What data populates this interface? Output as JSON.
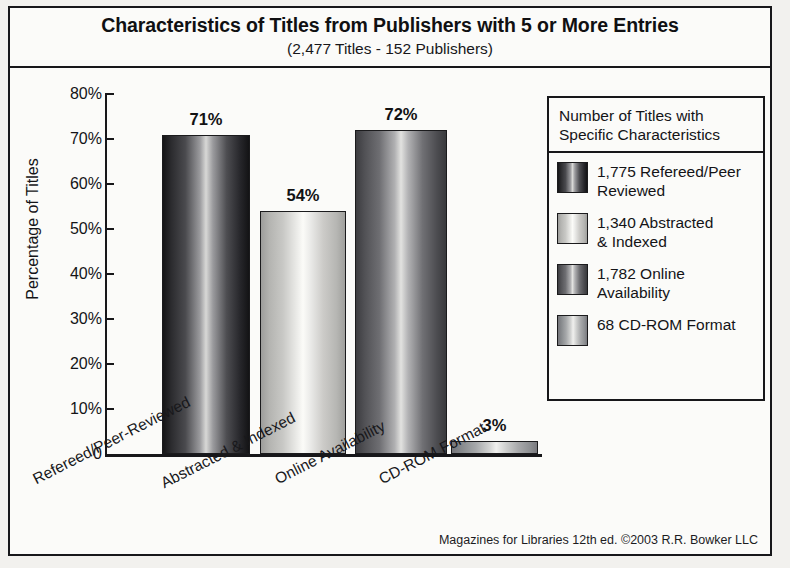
{
  "chart_data": {
    "type": "bar",
    "title": "Characteristics of Titles from Publishers with 5 or More Entries",
    "subtitle": "(2,477 Titles - 152 Publishers)",
    "xlabel": "",
    "ylabel": "Percentage of Titles",
    "categories": [
      "Refereed/Peer-Reviewed",
      "Abstracted & Indexed",
      "Online Availability",
      "CD-ROM Format"
    ],
    "values": [
      71,
      54,
      72,
      3
    ],
    "value_labels": [
      "71%",
      "54%",
      "72%",
      "3%"
    ],
    "counts": [
      1775,
      1340,
      1782,
      68
    ],
    "ylim": [
      0,
      80
    ],
    "yticks": [
      0,
      10,
      20,
      30,
      40,
      50,
      60,
      70,
      80
    ],
    "ytick_labels": [
      "0",
      "10%",
      "20%",
      "30%",
      "40%",
      "50%",
      "60%",
      "70%",
      "80%"
    ],
    "grid": false,
    "legend_position": "right",
    "bar_styles": [
      "bar-dark",
      "bar-light",
      "bar-mid",
      "bar-midlight"
    ]
  },
  "legend": {
    "heading_line1": "Number of Titles with",
    "heading_line2": "Specific Characteristics",
    "items": [
      {
        "label_line1": "1,775 Refereed/Peer",
        "label_line2": "Reviewed",
        "style": "bar-dark"
      },
      {
        "label_line1": "1,340 Abstracted",
        "label_line2": "& Indexed",
        "style": "bar-light"
      },
      {
        "label_line1": "1,782 Online",
        "label_line2": "Availability",
        "style": "bar-mid"
      },
      {
        "label_line1": "68 CD-ROM Format",
        "label_line2": "",
        "style": "bar-midlight"
      }
    ]
  },
  "credit": "Magazines for Libraries 12th ed. ©2003 R.R. Bowker LLC",
  "colors": {
    "frame": "#17171a",
    "paper": "#f2f1ee",
    "panel": "#fbfbf9",
    "text": "#141417"
  },
  "ghost_text": [
    {
      "t": "the Overall",
      "x": 300,
      "y": 42,
      "size": 21
    },
    {
      "t": "blications",
      "x": 470,
      "y": 60,
      "size": 19
    },
    {
      "t": "a little, the",
      "x": 190,
      "y": 78,
      "size": 17
    },
    {
      "t": "liable to variate",
      "x": 360,
      "y": 78,
      "size": 17
    },
    {
      "t": "Titles",
      "x": 230,
      "y": 100,
      "size": 18
    },
    {
      "t": "and Indexed contents of",
      "x": 320,
      "y": 100,
      "size": 18
    },
    {
      "t": "or the  list",
      "x": 230,
      "y": 128,
      "size": 18
    },
    {
      "t": "ed superset of these",
      "x": 320,
      "y": 128,
      "size": 18
    },
    {
      "t": "a large",
      "x": 235,
      "y": 156,
      "size": 18
    },
    {
      "t": "eneral interest",
      "x": 330,
      "y": 156,
      "size": 18
    },
    {
      "t": "ch in the numbers",
      "x": 210,
      "y": 196,
      "size": 18
    },
    {
      "t": "of titles listed",
      "x": 360,
      "y": 200,
      "size": 17
    },
    {
      "t": "ntage of Titles That Vary by Publisher S",
      "x": 180,
      "y": 466,
      "size": 20
    },
    {
      "t": "(5.05) for ten or more",
      "x": 200,
      "y": 500,
      "size": 19
    }
  ]
}
